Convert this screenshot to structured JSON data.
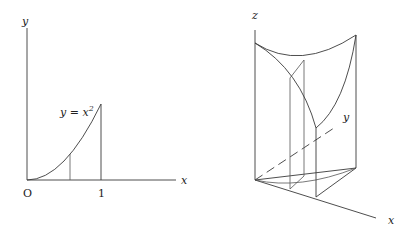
{
  "left_figure": {
    "y_axis_label": "y",
    "x_axis_label": "x",
    "origin_label": "O",
    "tick_label": "1",
    "curve_label_lhs": "y = x",
    "curve_label_exp": "2"
  },
  "right_figure": {
    "z_axis_label": "z",
    "y_axis_label": "y",
    "x_axis_label": "x"
  }
}
